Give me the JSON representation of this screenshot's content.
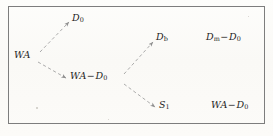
{
  "figure": {
    "kind": "reaction-scheme-diagram",
    "background_color": "#fcfbf9",
    "border_color": "#7d7d7d",
    "text_color": "#1d1d1d",
    "arrow_color": "#9a9a9a",
    "arrow_style": "dashed-with-arrowhead"
  },
  "nodes": {
    "source": {
      "id": "WA",
      "base": "WA",
      "subscript": "",
      "operator": "",
      "operand_base": "",
      "operand_subscript": "",
      "full_text": "WA"
    },
    "branch_upper": {
      "id": "D0",
      "base": "D",
      "subscript": "0",
      "operator": "",
      "operand_base": "",
      "operand_subscript": "",
      "full_text": "D0"
    },
    "branch_lower": {
      "id": "WA-D0",
      "base": "WA",
      "subscript": "",
      "operator": "−",
      "operand_base": "D",
      "operand_subscript": "0",
      "full_text": "WA−D0"
    },
    "branch_lower_upper": {
      "id": "Db",
      "base": "D",
      "subscript": "b",
      "operator": "",
      "operand_base": "",
      "operand_subscript": "",
      "full_text": "Db"
    },
    "branch_lower_lower": {
      "id": "S1",
      "base": "S",
      "subscript": "1",
      "operator": "",
      "operand_base": "",
      "operand_subscript": "",
      "full_text": "S1"
    }
  },
  "results": {
    "top_right": {
      "id": "Dm-D0",
      "base": "D",
      "subscript": "m",
      "operator": "−",
      "operand_base": "D",
      "operand_subscript": "0",
      "full_text": "Dm−D0"
    },
    "bottom_right": {
      "id": "WA-D0",
      "base": "WA",
      "subscript": "",
      "operator": "−",
      "operand_base": "D",
      "operand_subscript": "0",
      "full_text": "WA−D0"
    }
  },
  "arrows": [
    {
      "id": "wa-to-d0",
      "from": "WA",
      "to": "D0",
      "style": "dashed"
    },
    {
      "id": "wa-to-wa-d0",
      "from": "WA",
      "to": "WA-D0",
      "style": "dashed"
    },
    {
      "id": "wa-d0-to-db",
      "from": "WA-D0",
      "to": "Db",
      "style": "dashed"
    },
    {
      "id": "wa-d0-to-s1",
      "from": "WA-D0",
      "to": "S1",
      "style": "dashed"
    }
  ]
}
